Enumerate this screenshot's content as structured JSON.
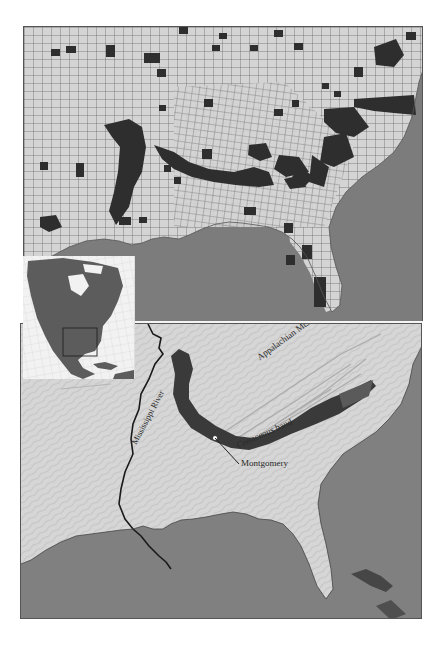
{
  "figure": {
    "type": "two-panel map",
    "top_panel": {
      "description": "Southeastern US county choropleth; dark-shaded counties highlighted",
      "colors": {
        "land": "#d4d4d4",
        "county_border": "#6a6a6a",
        "highlighted_county": "#2e2e2e",
        "water": "#7c7c7c"
      }
    },
    "inset": {
      "description": "North America locator map with box around southeastern United States",
      "colors": {
        "land": "#5c5c5c",
        "background": "#f2f2f2",
        "graticule": "#d0d0d0",
        "locator_box": "#222222"
      }
    },
    "bottom_panel": {
      "description": "Shaded relief map of southeastern US showing Cretaceous band",
      "colors": {
        "land": "#d6d6d6",
        "water": "#808080",
        "cretaceous_band": "#3a3a3a",
        "cretaceous_band_light": "#5a5a5a",
        "river": "#1a1a1a"
      },
      "labels": {
        "appalachian": "Appalachian Mts.",
        "cretaceous": "Cretaceous band",
        "mississippi": "Mississippi River",
        "montgomery": "Montgomery"
      }
    }
  }
}
